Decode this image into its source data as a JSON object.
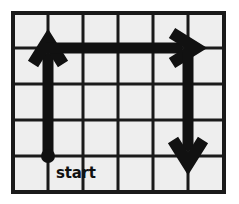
{
  "figure": {
    "kind": "grid-path-diagram",
    "background_color": "#ffffff",
    "cell_fill_color": "#eeeeee",
    "grid_line_color": "#1a1a1a",
    "path_color": "#111111",
    "grid": {
      "columns": 6,
      "rows": 5,
      "left": 13,
      "top": 13,
      "cell_width": 35.2,
      "cell_height": 35.8,
      "line_width": 3,
      "border_width": 4,
      "x_lines": [
        13,
        48,
        83,
        118,
        153,
        188,
        224
      ],
      "y_lines": [
        13,
        48,
        84,
        120,
        156,
        192
      ]
    },
    "start_marker": {
      "label": "start",
      "x": 48,
      "y": 156,
      "radius": 7,
      "label_x": 56,
      "label_y": 178
    },
    "segments": [
      {
        "name": "up-arrow",
        "direction": "up",
        "from_x": 48,
        "from_y": 156,
        "to_x": 48,
        "to_y": 40,
        "cells_traveled": 3,
        "stroke_width": 11,
        "head_width": 30,
        "head_length": 24
      },
      {
        "name": "right-arrow",
        "direction": "right",
        "from_x": 46,
        "from_y": 48,
        "to_x": 196,
        "to_y": 48,
        "cells_traveled": 4,
        "stroke_width": 11,
        "head_width": 30,
        "head_length": 24
      },
      {
        "name": "down-arrow",
        "direction": "down",
        "from_x": 188,
        "from_y": 52,
        "to_x": 188,
        "to_y": 164,
        "cells_traveled": 3,
        "stroke_width": 11,
        "head_width": 30,
        "head_length": 24
      }
    ]
  }
}
